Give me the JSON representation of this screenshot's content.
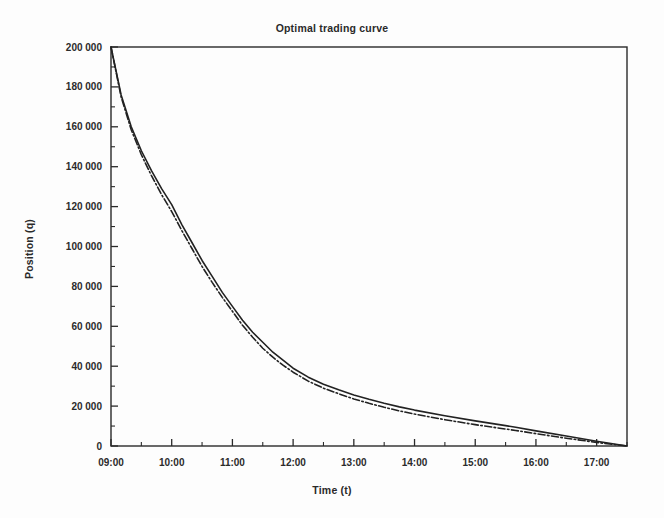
{
  "figure": {
    "title": "Optimal trading curve",
    "background_color": "#fdfdfd",
    "frame_color": "#2a2a2a"
  },
  "axes": {
    "x_title": "Time (t)",
    "y_title": "Position (q)"
  },
  "chart_data": {
    "type": "line",
    "title": "Optimal trading curve",
    "xlabel": "Time (t)",
    "ylabel": "Position (q)",
    "grid": false,
    "legend": "none",
    "xlim": [
      "09:00",
      "17:30"
    ],
    "ylim": [
      0,
      200000
    ],
    "x_tick_labels": [
      "09:00",
      "10:00",
      "11:00",
      "12:00",
      "13:00",
      "14:00",
      "15:00",
      "16:00",
      "17:00"
    ],
    "x_minor_ticks_per_interval": 1,
    "y_tick_labels": [
      "0",
      "20 000",
      "40 000",
      "60 000",
      "80 000",
      "100 000",
      "120 000",
      "140 000",
      "160 000",
      "180 000",
      "200 000"
    ],
    "y_tick_values": [
      0,
      20000,
      40000,
      60000,
      80000,
      100000,
      120000,
      140000,
      160000,
      180000,
      200000
    ],
    "y_minor_ticks_per_interval": 1,
    "x": [
      "09:00",
      "09:10",
      "09:20",
      "09:30",
      "09:40",
      "09:50",
      "10:00",
      "10:10",
      "10:20",
      "10:30",
      "10:40",
      "10:50",
      "11:00",
      "11:10",
      "11:20",
      "11:30",
      "11:40",
      "11:50",
      "12:00",
      "12:15",
      "12:30",
      "12:45",
      "13:00",
      "13:15",
      "13:30",
      "13:45",
      "14:00",
      "14:30",
      "15:00",
      "15:30",
      "15:40",
      "16:00",
      "16:30",
      "17:00",
      "17:30"
    ],
    "series": [
      {
        "name": "solid-curve",
        "style": "solid",
        "color": "#222222",
        "width": 1.6,
        "values": [
          200000,
          176000,
          160000,
          148000,
          138000,
          129000,
          121000,
          111000,
          102000,
          93000,
          85000,
          77000,
          70000,
          63000,
          57000,
          52000,
          47000,
          43000,
          39000,
          34500,
          31000,
          28200,
          25600,
          23400,
          21400,
          19600,
          18000,
          15200,
          12600,
          10200,
          9400,
          7600,
          5000,
          2400,
          0
        ]
      },
      {
        "name": "dash-dot-curve",
        "style": "dash-dot",
        "color": "#222222",
        "width": 1.6,
        "values": [
          200000,
          175000,
          158500,
          146000,
          135500,
          126000,
          117500,
          108000,
          99000,
          90000,
          82000,
          74500,
          67500,
          60500,
          54500,
          49000,
          44500,
          40500,
          37000,
          32500,
          29000,
          26200,
          23600,
          21400,
          19400,
          17600,
          16000,
          13200,
          10700,
          8500,
          7800,
          6200,
          3900,
          1800,
          0
        ]
      }
    ]
  }
}
